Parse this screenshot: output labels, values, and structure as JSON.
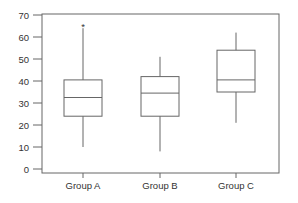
{
  "chart_data": {
    "type": "box",
    "title": "",
    "xlabel": "",
    "ylabel": "",
    "ylim": [
      0,
      70
    ],
    "yticks": [
      0,
      10,
      20,
      30,
      40,
      50,
      60,
      70
    ],
    "grid": false,
    "categories": [
      "Group A",
      "Group B",
      "Group C"
    ],
    "series": [
      {
        "name": "Group A",
        "whisker_low": 10,
        "q1": 24,
        "median": 32.5,
        "q3": 40.5,
        "whisker_high": 64,
        "outliers": [
          65
        ]
      },
      {
        "name": "Group B",
        "whisker_low": 8,
        "q1": 24,
        "median": 34.5,
        "q3": 42,
        "whisker_high": 51,
        "outliers": []
      },
      {
        "name": "Group C",
        "whisker_low": 21,
        "q1": 35,
        "median": 40.5,
        "q3": 54,
        "whisker_high": 62,
        "outliers": []
      }
    ]
  },
  "colors": {
    "stroke": "#666666",
    "text": "#333333",
    "background": "#ffffff"
  }
}
